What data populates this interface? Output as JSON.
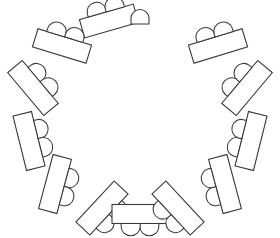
{
  "diagram": {
    "type": "floor-plan",
    "canvas": {
      "width": 280,
      "height": 238
    },
    "style": {
      "background_color": "#ffffff",
      "stroke_color": "#3a3a3a",
      "fill_color": "#ffffff",
      "stroke_width": 1.1
    },
    "arrangement": {
      "shape": "horseshoe",
      "open_side": "top",
      "center_x": 140,
      "center_y": 120,
      "radius_x": 112,
      "radius_y": 103,
      "table_count": 12,
      "chairs_per_table": 2,
      "total_table_chairs": 24,
      "standalone_chair_count": 1,
      "total_chairs": 25
    },
    "table_defaults": {
      "length": 58,
      "width": 20,
      "chair_radius": 9.5,
      "chair_offset": 9
    },
    "tables": [
      {
        "id": "table-1",
        "label": "T1",
        "angle_deg": 254,
        "center_x": 109,
        "center_y": 21,
        "rotation_deg": 344,
        "length": 56,
        "width": 19,
        "chairs": 2
      },
      {
        "id": "table-2",
        "label": "T2",
        "angle_deg": 226,
        "center_x": 62,
        "center_y": 46,
        "rotation_deg": 17,
        "length": 56,
        "width": 19,
        "chairs": 2
      },
      {
        "id": "table-3",
        "label": "T3",
        "angle_deg": 198,
        "center_x": 33,
        "center_y": 88,
        "rotation_deg": 50,
        "length": 56,
        "width": 19,
        "chairs": 2
      },
      {
        "id": "table-4",
        "label": "T4",
        "angle_deg": 170,
        "center_x": 29,
        "center_y": 141,
        "rotation_deg": 76,
        "length": 56,
        "width": 19,
        "chairs": 2
      },
      {
        "id": "table-5",
        "label": "T5",
        "angle_deg": 142,
        "center_x": 55,
        "center_y": 184,
        "rotation_deg": 105,
        "length": 56,
        "width": 19,
        "chairs": 2
      },
      {
        "id": "table-6",
        "label": "T6",
        "angle_deg": 114,
        "center_x": 102,
        "center_y": 208,
        "rotation_deg": 133,
        "length": 56,
        "width": 19,
        "chairs": 2
      },
      {
        "id": "table-7",
        "label": "T7",
        "angle_deg": 90,
        "center_x": 140,
        "center_y": 214,
        "rotation_deg": 180,
        "length": 56,
        "width": 19,
        "chairs": 2
      },
      {
        "id": "table-8",
        "label": "T8",
        "angle_deg": 66,
        "center_x": 178,
        "center_y": 208,
        "rotation_deg": 227,
        "length": 56,
        "width": 19,
        "chairs": 2
      },
      {
        "id": "table-9",
        "label": "T9",
        "angle_deg": 38,
        "center_x": 225,
        "center_y": 184,
        "rotation_deg": 255,
        "length": 56,
        "width": 19,
        "chairs": 2
      },
      {
        "id": "table-10",
        "label": "T10",
        "angle_deg": 10,
        "center_x": 251,
        "center_y": 141,
        "rotation_deg": 284,
        "length": 56,
        "width": 19,
        "chairs": 2
      },
      {
        "id": "table-11",
        "label": "T11",
        "angle_deg": 342,
        "center_x": 247,
        "center_y": 88,
        "rotation_deg": 310,
        "length": 56,
        "width": 19,
        "chairs": 2
      },
      {
        "id": "table-12",
        "label": "T12",
        "angle_deg": 314,
        "center_x": 218,
        "center_y": 46,
        "rotation_deg": 343,
        "length": 56,
        "width": 19,
        "chairs": 2
      }
    ],
    "standalone_chair": {
      "id": "chair-solo",
      "label": "Head chair",
      "center_x": 140,
      "center_y": 19,
      "radius": 9,
      "rotation_deg": 0
    }
  }
}
